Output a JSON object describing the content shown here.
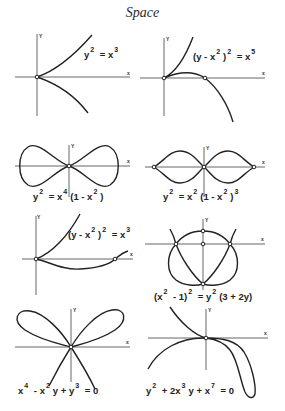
{
  "title": "Space",
  "axis_labels": {
    "x": "x",
    "y": "Y"
  },
  "panels": [
    {
      "id": 1,
      "equation": {
        "parts": [
          "y",
          "2",
          " = x",
          "3"
        ]
      },
      "equation_text": "y^2 = x^3",
      "description": "Cusp at origin; upper branch rising right, lower branch falling right"
    },
    {
      "id": 2,
      "equation": {
        "parts": [
          "(y - x",
          "2",
          ")",
          "2",
          " = x",
          "5"
        ]
      },
      "equation_text": "(y - x^2)^2 = x^5",
      "description": "Ramphoid cusp at origin; second branch crosses x-axis and descends"
    },
    {
      "id": 3,
      "equation": {
        "parts": [
          "y",
          "2",
          " = x",
          "4",
          "(1 - x",
          "2",
          ")"
        ]
      },
      "equation_text": "y^2 = x^4 (1 - x^2)",
      "description": "Bow-tie curve with tacnode at origin"
    },
    {
      "id": 4,
      "equation": {
        "parts": [
          "y",
          "2",
          " = x",
          "2",
          "(1 - x",
          "2",
          ")",
          "3"
        ]
      },
      "equation_text": "y^2 = x^2 (1 - x^2)^3",
      "description": "Figure-eight with node at origin and cusps at x = ±1"
    },
    {
      "id": 5,
      "equation": {
        "parts": [
          "(y - x",
          "2",
          ")",
          "2",
          " = x",
          "3"
        ]
      },
      "equation_text": "(y - x^2)^2 = x^3",
      "description": "Cusp at origin; lower branch dips below and crosses x-axis"
    },
    {
      "id": 6,
      "equation": {
        "parts": [
          "(x",
          "2",
          " - 1)",
          "2",
          " = y",
          "2",
          "(3 + 2y)"
        ]
      },
      "equation_text": "(x^2 - 1)^2 = y^2 (3 + 2y)",
      "description": "Heart-shaped curve with nodes at (±1, 0) and cusp at bottom"
    },
    {
      "id": 7,
      "equation": {
        "parts": [
          "x",
          "4",
          " - x",
          "2",
          "y + y",
          "3",
          " = 0"
        ]
      },
      "equation_text": "x^4 - x^2 y + y^3 = 0",
      "description": "Butterfly curve with two loops above and two branches below"
    },
    {
      "id": 8,
      "equation": {
        "parts": [
          "y",
          "2",
          " + 2x",
          "3",
          "y + x",
          "7",
          " = 0"
        ]
      },
      "equation_text": "y^2 + 2x^3 y + x^7 = 0",
      "description": "Two branches tangent at origin, forming a loop in lower right"
    }
  ],
  "colors": {
    "background": "#ffffff",
    "curve": "#222222",
    "axis": "#555555",
    "text": "#222222"
  }
}
